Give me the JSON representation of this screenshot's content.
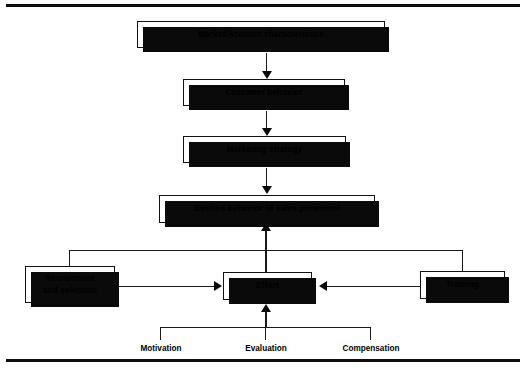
{
  "figure": {
    "nodes": {
      "market": "Market/Account characteristics",
      "customer": "Customer behavior",
      "strategy": "Marketing strategy",
      "desired": "Desired behavior of sales personnel",
      "effort": "Effort",
      "recruitment_line1": "Recruitment",
      "recruitment_line2": "and selection",
      "training": "Training"
    },
    "leaf_labels": {
      "motivation": "Motivation",
      "evaluation": "Evaluation",
      "compensation": "Compensation"
    },
    "colors": {
      "line": "#1a1a1a",
      "box_border": "#111111",
      "shadow": "#0a0a0a",
      "background": "#ffffff",
      "rule": "#0d0d0d"
    }
  }
}
